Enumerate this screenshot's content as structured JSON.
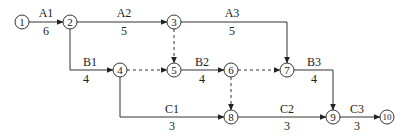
{
  "diagram": {
    "type": "activity-on-arrow network",
    "nodes": [
      {
        "id": "1",
        "label": "1",
        "x": 22,
        "y": 22
      },
      {
        "id": "2",
        "label": "2",
        "x": 70,
        "y": 22
      },
      {
        "id": "3",
        "label": "3",
        "x": 174,
        "y": 22
      },
      {
        "id": "4",
        "label": "4",
        "x": 120,
        "y": 70
      },
      {
        "id": "5",
        "label": "5",
        "x": 174,
        "y": 70
      },
      {
        "id": "6",
        "label": "6",
        "x": 231,
        "y": 70
      },
      {
        "id": "7",
        "label": "7",
        "x": 287,
        "y": 70
      },
      {
        "id": "8",
        "label": "8",
        "x": 231,
        "y": 117
      },
      {
        "id": "9",
        "label": "9",
        "x": 333,
        "y": 117
      },
      {
        "id": "10",
        "label": "10",
        "x": 387,
        "y": 117
      }
    ],
    "activities": [
      {
        "name": "A1",
        "duration": "6",
        "from": "1",
        "to": "2",
        "dummy": false
      },
      {
        "name": "A2",
        "duration": "5",
        "from": "2",
        "to": "3",
        "dummy": false
      },
      {
        "name": "A3",
        "duration": "5",
        "from": "3",
        "to": "7",
        "dummy": false
      },
      {
        "name": "B1",
        "duration": "4",
        "from": "2",
        "to": "4",
        "dummy": false
      },
      {
        "name": "B2",
        "duration": "4",
        "from": "5",
        "to": "6",
        "dummy": false
      },
      {
        "name": "B3",
        "duration": "4",
        "from": "7",
        "to": "9",
        "dummy": false
      },
      {
        "name": "C1",
        "duration": "3",
        "from": "4",
        "to": "8",
        "dummy": false
      },
      {
        "name": "C2",
        "duration": "3",
        "from": "8",
        "to": "9",
        "dummy": false
      },
      {
        "name": "C3",
        "duration": "3",
        "from": "9",
        "to": "10",
        "dummy": false
      },
      {
        "name": "",
        "duration": "",
        "from": "3",
        "to": "5",
        "dummy": true
      },
      {
        "name": "",
        "duration": "",
        "from": "4",
        "to": "5",
        "dummy": true
      },
      {
        "name": "",
        "duration": "",
        "from": "6",
        "to": "7",
        "dummy": true
      },
      {
        "name": "",
        "duration": "",
        "from": "6",
        "to": "8",
        "dummy": true
      }
    ]
  },
  "labels": {
    "A1": {
      "name": "A1",
      "duration": "6"
    },
    "A2": {
      "name": "A2",
      "duration": "5"
    },
    "A3": {
      "name": "A3",
      "duration": "5"
    },
    "B1": {
      "name": "B1",
      "duration": "4"
    },
    "B2": {
      "name": "B2",
      "duration": "4"
    },
    "B3": {
      "name": "B3",
      "duration": "4"
    },
    "C1": {
      "name": "C1",
      "duration": "3"
    },
    "C2": {
      "name": "C2",
      "duration": "3"
    },
    "C3": {
      "name": "C3",
      "duration": "3"
    }
  },
  "node_labels": {
    "n1": "1",
    "n2": "2",
    "n3": "3",
    "n4": "4",
    "n5": "5",
    "n6": "6",
    "n7": "7",
    "n8": "8",
    "n9": "9",
    "n10": "10"
  }
}
